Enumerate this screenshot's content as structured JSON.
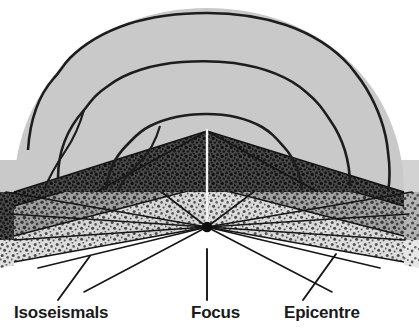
{
  "figure": {
    "kind": "earthquake-cross-section-diagram",
    "title_visible": false,
    "width": 419,
    "height": 333,
    "background": "#ffffff"
  },
  "labels": {
    "isoseismals": "Isoseismals",
    "focus": "Focus",
    "epicentre": "Epicentre"
  },
  "colors": {
    "page_background": "#ffffff",
    "ground_surface": "#c9c9c9",
    "contour_line": "#1d1d1d",
    "dark_layer": "#4a4a4a",
    "dark_layer_speckle": "#1e1e1e",
    "mid_layer": "#9b9b9b",
    "mid_layer_speckle": "#3a3a3a",
    "light_layer": "#dcdcdc",
    "light_layer_speckle": "#4d4d4d",
    "ray_line": "#161616",
    "focus_dot": "#0d0d0d",
    "axis_line_white": "#f2f2f2",
    "label_text": "#1a1a1a",
    "leader_line": "#151515"
  },
  "geometry": {
    "dome": {
      "description": "plan-view ground surface shown as a dome / half ellipse",
      "left_edge_x": 14,
      "right_edge_x": 404,
      "top_y": 8,
      "base_y": 192
    },
    "epicentre_point": {
      "x": 207,
      "y": 131
    },
    "focus_point": {
      "x": 207,
      "y": 227
    },
    "focus_dot_radius": 5,
    "layer_bands": [
      {
        "name": "surface-band",
        "top": 160,
        "bottom": 192
      },
      {
        "name": "dark-band",
        "top": 192,
        "bottom": 240
      },
      {
        "name": "light-band",
        "top": 240,
        "bottom": 290
      }
    ],
    "ray_count": 12,
    "wedge_apex": {
      "x": 207,
      "y": 131
    }
  },
  "contours": {
    "count": 3,
    "names": [
      "isoseismal-outer",
      "isoseismal-middle",
      "isoseismal-inner"
    ]
  },
  "leaders": [
    {
      "name": "isoseismals-leader",
      "x1": 88,
      "y1": 258,
      "x2": 58,
      "y2": 300
    },
    {
      "name": "focus-leader",
      "x1": 207,
      "y1": 249,
      "x2": 207,
      "y2": 300
    },
    {
      "name": "epicentre-leader",
      "x1": 334,
      "y1": 255,
      "x2": 302,
      "y2": 300
    }
  ]
}
